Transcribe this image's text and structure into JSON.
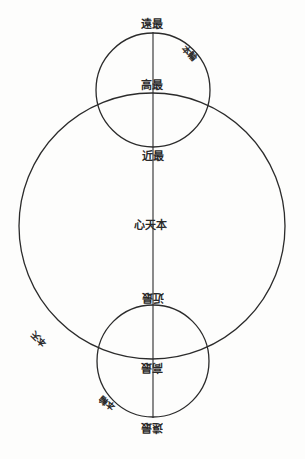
{
  "diagram": {
    "title": "",
    "colors": {
      "line": "#2b2b2b",
      "background": "#fdfdfc",
      "text": "#2a2a2a"
    },
    "shapes": {
      "deferent_circle": {
        "cx": 152,
        "cy": 226,
        "r": 133
      },
      "upper_epicycle": {
        "cx": 153,
        "cy": 90,
        "r": 57
      },
      "lower_epicycle": {
        "cx": 153,
        "cy": 361,
        "r": 56
      },
      "axis_line": {
        "x": 153,
        "y1": 32,
        "y2": 418
      }
    },
    "labels": {
      "upper_farthest": "遠最",
      "upper_epicycle": "本輪",
      "upper_highest": "高最",
      "upper_nearest": "近最",
      "center": "心天本",
      "lower_nearest": "近最",
      "lower_highest": "高最",
      "lower_farthest": "遠最",
      "lower_epicycle": "本輪",
      "deferent": "本天"
    }
  }
}
